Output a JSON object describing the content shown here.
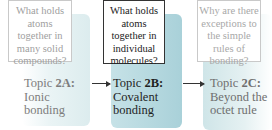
{
  "diagram": {
    "topics": [
      {
        "id": "2A",
        "question": "What holds atoms together in many solid compounds?",
        "prefix": "Topic ",
        "code": "2A:",
        "title": "Ionic bonding",
        "state": "inactive"
      },
      {
        "id": "2B",
        "question": "What holds atoms together in individual molecules?",
        "prefix": "Topic ",
        "code": "2B:",
        "title": "Covalent bonding",
        "state": "active"
      },
      {
        "id": "2C",
        "question": "Why are there exceptions to the simple rules of bonding?",
        "prefix": "Topic ",
        "code": "2C:",
        "title": "Beyond the octet rule",
        "state": "inactive"
      }
    ],
    "colors": {
      "active_panel": "#b5d8de",
      "inactive_panel": "#e2eff1",
      "arrow": "#333333"
    }
  }
}
